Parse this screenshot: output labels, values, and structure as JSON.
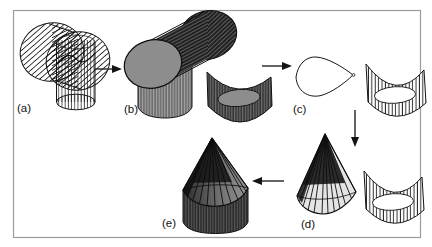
{
  "figure": {
    "background": "#ffffff",
    "frame_color": "#9b9b9b",
    "ink_color": "#111111",
    "gray_surface_color": "#8d8d8d",
    "panels": [
      {
        "id": "a",
        "label": "(a)",
        "depicts": "two-intersecting-cylinders-wireframe"
      },
      {
        "id": "b",
        "label": "(b)",
        "depicts": "two-intersecting-cylinders-solid-with-cut-shell-piece"
      },
      {
        "id": "c",
        "label": "(c)",
        "depicts": "intersection-curve-outline-and-open-shell"
      },
      {
        "id": "d",
        "label": "(d)",
        "depicts": "ruled-cone-over-intersection-curve"
      },
      {
        "id": "e",
        "label": "(e)",
        "depicts": "cone-capped-cylinder"
      }
    ],
    "arrows": [
      {
        "from": "a",
        "to": "b",
        "direction": "right"
      },
      {
        "from": "b",
        "to": "c",
        "direction": "right"
      },
      {
        "from": "c",
        "to": "d",
        "direction": "down"
      },
      {
        "from": "d",
        "to": "e",
        "direction": "left"
      }
    ]
  }
}
